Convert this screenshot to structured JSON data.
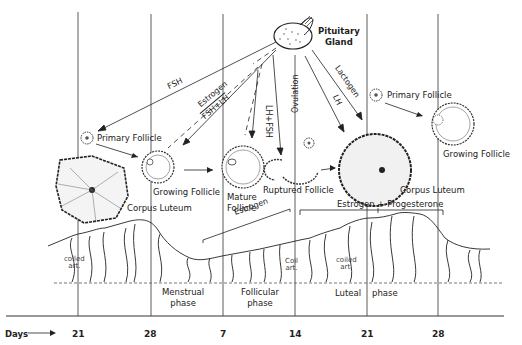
{
  "diagram": {
    "type": "menstrual cycle diagram",
    "gland": {
      "label_line1": "Pituitary",
      "label_line2": "Gland"
    },
    "hormone_arrows": {
      "fsh": "FSH",
      "estrogen_top": "Estrogen",
      "fsh_lh": "FSH+LH",
      "lh_fsh": "LH+FSH",
      "lh": "LH",
      "lactogen": "Lactogen"
    },
    "events": {
      "ovulation": "Ovulation"
    },
    "ovary_stages": {
      "primary_follicle_left": "Primary Follicle",
      "corpus_luteum_left": "Corpus Luteum",
      "growing_follicle_left": "Growing Follicle",
      "mature_follicle_line1": "Mature",
      "mature_follicle_line2": "Follicle",
      "ruptured_follicle": "Ruptured Follicle",
      "corpus_luteum_right": "Corpus Luteum",
      "primary_follicle_right": "Primary Follicle",
      "growing_follicle_right": "Growing Follicle"
    },
    "hormone_brackets": {
      "estrogen": "Estrogen",
      "estrogen_progesterone": "Estrogen + Progesterone"
    },
    "endometrium_labels": {
      "coiled_art_left_1": "coiled",
      "coiled_art_left_2": "art.",
      "coil_art_mid_1": "Coil",
      "coil_art_mid_2": "art.",
      "coiled_art_right_1": "coiled",
      "coiled_art_right_2": "art."
    },
    "phases": {
      "menstrual_1": "Menstrual",
      "menstrual_2": "phase",
      "follicular_1": "Follicular",
      "follicular_2": "phase",
      "luteal_1": "Luteal",
      "luteal_2": "phase"
    },
    "axis": {
      "label": "Days",
      "arrow": "→",
      "ticks": [
        "21",
        "28",
        "7",
        "14",
        "21",
        "28"
      ]
    }
  }
}
